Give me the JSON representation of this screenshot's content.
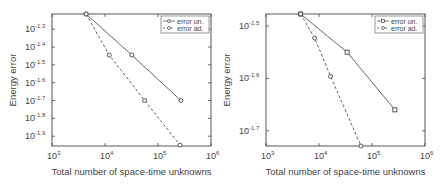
{
  "chart_data": [
    {
      "type": "line",
      "title": "",
      "xlabel": "Total number of space-time unknowns",
      "ylabel": "Energy error",
      "xscale": "log",
      "yscale": "log",
      "xlim": [
        1000,
        1000000
      ],
      "ylim_exponent": [
        -1.955,
        -1.215
      ],
      "x_ticks": [
        {
          "base": "10",
          "exp": "3"
        },
        {
          "base": "10",
          "exp": "4"
        },
        {
          "base": "10",
          "exp": "5"
        },
        {
          "base": "10",
          "exp": "6"
        }
      ],
      "y_ticks": [
        {
          "base": "10",
          "exp": "-1.3"
        },
        {
          "base": "10",
          "exp": "-1.4"
        },
        {
          "base": "10",
          "exp": "-1.5"
        },
        {
          "base": "10",
          "exp": "-1.6"
        },
        {
          "base": "10",
          "exp": "-1.7"
        },
        {
          "base": "10",
          "exp": "-1.8"
        },
        {
          "base": "10",
          "exp": "-1.9"
        }
      ],
      "legend_position": "upper right",
      "grid": false,
      "series": [
        {
          "name": "error un.",
          "style": "solid",
          "marker": "circle",
          "x": [
            4400,
            32000,
            270000
          ],
          "y_exponent": [
            -1.215,
            -1.445,
            -1.7
          ]
        },
        {
          "name": "error ad.",
          "style": "dashed",
          "marker": "circle",
          "x": [
            4400,
            12000,
            56000,
            260000
          ],
          "y_exponent": [
            -1.215,
            -1.445,
            -1.7,
            -1.95
          ]
        }
      ]
    },
    {
      "type": "line",
      "title": "",
      "xlabel": "Total number of space-time unknowns",
      "ylabel": "Energy error",
      "xscale": "log",
      "yscale": "log",
      "xlim": [
        1000,
        1000000
      ],
      "ylim_exponent": [
        -1.729,
        -1.477
      ],
      "x_ticks": [
        {
          "base": "10",
          "exp": "3"
        },
        {
          "base": "10",
          "exp": "4"
        },
        {
          "base": "10",
          "exp": "5"
        },
        {
          "base": "10",
          "exp": "6"
        }
      ],
      "y_ticks": [
        {
          "base": "10",
          "exp": "-1.5"
        },
        {
          "base": "10",
          "exp": "-1.6"
        },
        {
          "base": "10",
          "exp": "-1.7"
        }
      ],
      "legend_position": "upper right",
      "grid": false,
      "series": [
        {
          "name": "error un.",
          "style": "solid",
          "marker": "square",
          "x": [
            4500,
            34000,
            270000
          ],
          "y_exponent": [
            -1.477,
            -1.55,
            -1.66
          ]
        },
        {
          "name": "error ad.",
          "style": "dashed",
          "marker": "circle",
          "x": [
            4500,
            8300,
            16500,
            62000
          ],
          "y_exponent": [
            -1.477,
            -1.523,
            -1.596,
            -1.729
          ]
        }
      ]
    }
  ],
  "plots": [
    {
      "xlabel": "Total number of space-time unknowns",
      "ylabel": "Energy error",
      "legend": [
        "error un.",
        "error ad."
      ]
    },
    {
      "xlabel": "Total number of space-time unknowns",
      "ylabel": "Energy error",
      "legend": [
        "error un.",
        "error ad."
      ]
    }
  ]
}
